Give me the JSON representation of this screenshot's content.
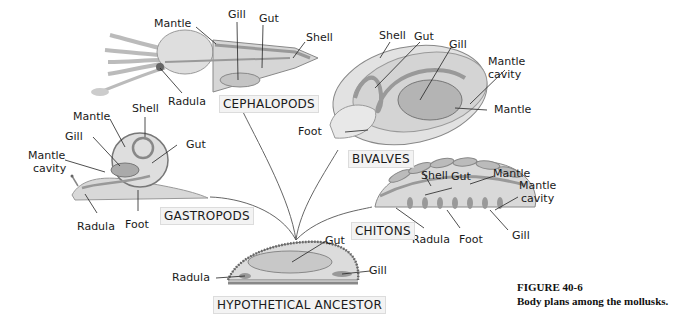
{
  "figure": {
    "title": "FIGURE 40-6",
    "caption": "Body plans among the mollusks."
  },
  "groups": {
    "cephalopods": {
      "name": "CEPHALOPODS",
      "labels": {
        "mantle": "Mantle",
        "gill": "Gill",
        "gut": "Gut",
        "shell": "Shell",
        "radula": "Radula"
      }
    },
    "bivalves": {
      "name": "BIVALVES",
      "labels": {
        "shell": "Shell",
        "gut": "Gut",
        "gill": "Gill",
        "mantle_cavity_1": "Mantle",
        "mantle_cavity_2": "cavity",
        "mantle": "Mantle",
        "foot": "Foot"
      }
    },
    "gastropods": {
      "name": "GASTROPODS",
      "labels": {
        "mantle": "Mantle",
        "shell": "Shell",
        "gill": "Gill",
        "gut": "Gut",
        "mantle_cavity_1": "Mantle",
        "mantle_cavity_2": "cavity",
        "radula": "Radula",
        "foot": "Foot"
      }
    },
    "chitons": {
      "name": "CHITONS",
      "labels": {
        "shell": "Shell",
        "gut": "Gut",
        "mantle": "Mantle",
        "mantle_cavity_1": "Mantle",
        "mantle_cavity_2": "cavity",
        "radula": "Radula",
        "foot": "Foot",
        "gill": "Gill"
      }
    },
    "ancestor": {
      "name": "HYPOTHETICAL ANCESTOR",
      "labels": {
        "gut": "Gut",
        "radula": "Radula",
        "gill": "Gill"
      }
    }
  },
  "colors": {
    "body": "#d9d9d9",
    "body_dark": "#a8a8a8",
    "outline": "#6e6e6e",
    "line": "#333333",
    "label_box": "#f3f3f3"
  }
}
